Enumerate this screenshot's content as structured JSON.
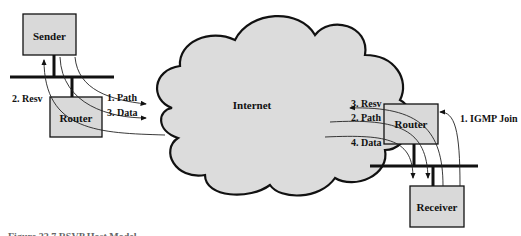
{
  "diagram": {
    "cloud_label": "Internet",
    "sender": {
      "label": "Sender"
    },
    "left_router": {
      "label": "Router"
    },
    "right_router": {
      "label": "Router"
    },
    "receiver": {
      "label": "Receiver"
    },
    "left_flows": [
      {
        "label": "1. Path"
      },
      {
        "label": "2. Resv"
      },
      {
        "label": "3. Data"
      }
    ],
    "right_flows": [
      {
        "label": "1. IGMP Join"
      },
      {
        "label": "2. Path"
      },
      {
        "label": "3. Resv"
      },
      {
        "label": "4. Data"
      }
    ],
    "caption": "Figure 22.7   RSVP Host Model"
  }
}
